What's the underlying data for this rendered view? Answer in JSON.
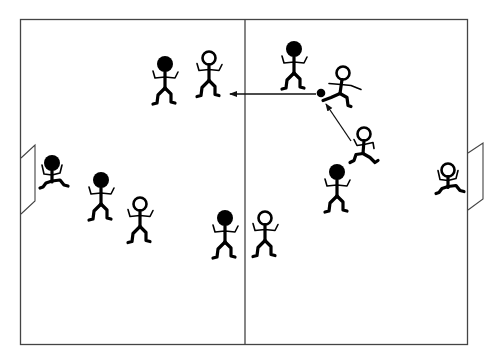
{
  "diagram": {
    "field": {
      "line_color": "#333333",
      "halves": [
        "left-half",
        "right-half"
      ],
      "goals": [
        "left-goal",
        "right-goal"
      ]
    },
    "teams": {
      "solid": {
        "label": "solid-head team",
        "color": "#000000"
      },
      "hollow": {
        "label": "hollow-head team",
        "color": "#000000"
      }
    },
    "players": [
      {
        "id": "solid-1",
        "team": "solid",
        "pose": "standing",
        "zone": "left-half-top"
      },
      {
        "id": "hollow-1",
        "team": "hollow",
        "pose": "standing",
        "zone": "left-half-top"
      },
      {
        "id": "solid-gk",
        "team": "solid",
        "pose": "goalkeeper-crouch",
        "zone": "left-goal"
      },
      {
        "id": "solid-2",
        "team": "solid",
        "pose": "standing",
        "zone": "left-half-middle"
      },
      {
        "id": "hollow-2",
        "team": "hollow",
        "pose": "standing",
        "zone": "left-half-middle"
      },
      {
        "id": "solid-3",
        "team": "solid",
        "pose": "standing",
        "zone": "center-bottom"
      },
      {
        "id": "hollow-3",
        "team": "hollow",
        "pose": "standing",
        "zone": "center-bottom"
      },
      {
        "id": "solid-4",
        "team": "solid",
        "pose": "standing",
        "zone": "right-half-top"
      },
      {
        "id": "hollow-kicker",
        "team": "hollow",
        "pose": "kicking",
        "zone": "right-half-top"
      },
      {
        "id": "hollow-runner",
        "team": "hollow",
        "pose": "running",
        "zone": "right-half-middle"
      },
      {
        "id": "solid-5",
        "team": "solid",
        "pose": "standing",
        "zone": "right-half-middle"
      },
      {
        "id": "hollow-gk",
        "team": "hollow",
        "pose": "goalkeeper-crouch",
        "zone": "right-goal"
      }
    ],
    "ball": {
      "color": "#000000"
    },
    "arrows": [
      {
        "id": "pass-arrow",
        "meaning": "ball passed leftward across the center line"
      },
      {
        "id": "run-arrow",
        "meaning": "runner's path toward the ball"
      }
    ]
  }
}
